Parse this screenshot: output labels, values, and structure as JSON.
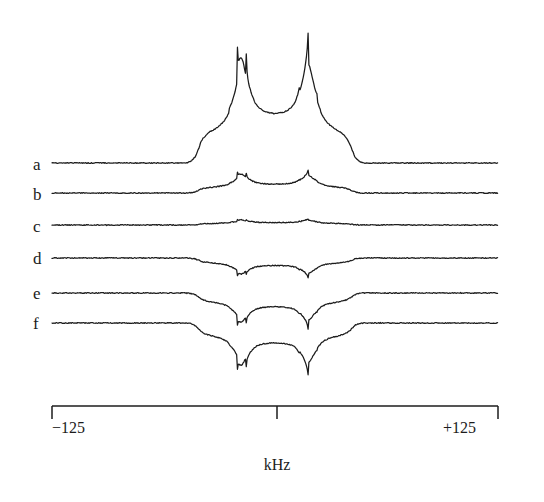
{
  "figure": {
    "background_color": "#ffffff",
    "line_color": "#1c1c1c",
    "width": 544,
    "height": 502
  },
  "axis": {
    "title": "kHz",
    "left_label": "−125",
    "center_label": "",
    "right_label": "+125",
    "x_min": -125,
    "x_max": 125,
    "ticks": [
      -125,
      0,
      125
    ],
    "tick_direction": "up",
    "pixel_left": 52,
    "pixel_right": 498,
    "pixel_center": 277,
    "pixel_baseline_y": 406,
    "tick_length": 13
  },
  "traces": [
    {
      "label": "a",
      "baseline_y": 163,
      "amplitude": -145,
      "label_x": 33,
      "label_y": 156
    },
    {
      "label": "b",
      "baseline_y": 193,
      "amplitude": -26,
      "label_x": 33,
      "label_y": 186
    },
    {
      "label": "c",
      "baseline_y": 225,
      "amplitude": -7,
      "label_x": 33,
      "label_y": 218
    },
    {
      "label": "d",
      "baseline_y": 258,
      "amplitude": 22,
      "label_x": 33,
      "label_y": 250
    },
    {
      "label": "e",
      "baseline_y": 293,
      "amplitude": 40,
      "label_x": 33,
      "label_y": 285
    },
    {
      "label": "f",
      "baseline_y": 323,
      "amplitude": 58,
      "label_x": 33,
      "label_y": 315
    }
  ],
  "chart_data": {
    "type": "line",
    "title": "",
    "xlabel": "kHz",
    "ylabel": "",
    "xlim": [
      -125,
      125
    ],
    "grid": false,
    "legend": "none",
    "xticks": [
      -125,
      0,
      125
    ],
    "xticklabels": [
      "−125",
      "",
      "+125"
    ],
    "pake_parameters": {
      "horn_positions_khz": [
        -19,
        19
      ],
      "shoulder_positions_khz": [
        -43,
        43
      ],
      "horn_half_width_khz": 2.2
    },
    "series": [
      {
        "name": "a",
        "relative_amplitude": 1.0,
        "sign": "positive",
        "horn_peak_khz": [
          -19,
          19
        ]
      },
      {
        "name": "b",
        "relative_amplitude": 0.18,
        "sign": "positive",
        "horn_peak_khz": [
          -19,
          19
        ]
      },
      {
        "name": "c",
        "relative_amplitude": 0.048,
        "sign": "positive",
        "horn_peak_khz": [
          -19,
          19
        ]
      },
      {
        "name": "d",
        "relative_amplitude": 0.15,
        "sign": "negative",
        "horn_peak_khz": [
          -19,
          19
        ]
      },
      {
        "name": "e",
        "relative_amplitude": 0.28,
        "sign": "negative",
        "horn_peak_khz": [
          -19,
          19
        ]
      },
      {
        "name": "f",
        "relative_amplitude": 0.4,
        "sign": "negative",
        "horn_peak_khz": [
          -19,
          19
        ]
      }
    ]
  }
}
